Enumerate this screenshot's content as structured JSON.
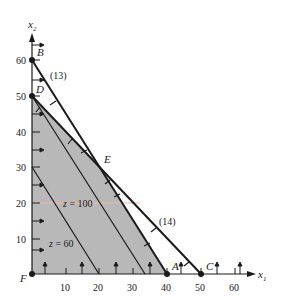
{
  "diagram": {
    "type": "linear-programming-feasible-region",
    "axes": {
      "x_label": "x",
      "x_sub": "1",
      "y_label": "x",
      "y_sub": "2",
      "x_ticks": [
        "10",
        "20",
        "30",
        "40",
        "50",
        "60"
      ],
      "y_ticks": [
        "10",
        "20",
        "30",
        "40",
        "50",
        "60"
      ]
    },
    "points": {
      "A": {
        "label": "A",
        "x1": 40,
        "x2": 0
      },
      "B": {
        "label": "B",
        "x1": 0,
        "x2": 60
      },
      "C": {
        "label": "C",
        "x1": 50,
        "x2": 0
      },
      "D": {
        "label": "D",
        "x1": 0,
        "x2": 50
      },
      "E": {
        "label": "E",
        "x1": 20,
        "x2": 30
      },
      "F": {
        "label": "F",
        "x1": 0,
        "x2": 0
      }
    },
    "constraints": [
      {
        "label": "(13)",
        "from": "B",
        "to": "A"
      },
      {
        "label": "(14)",
        "from": "D",
        "to": "C"
      }
    ],
    "feasible_region": [
      "F",
      "D",
      "E",
      "A"
    ],
    "iso_lines": [
      {
        "label_z": "z",
        "label_eq": " = 60",
        "from": [
          0,
          30
        ],
        "to": [
          20,
          0
        ]
      },
      {
        "label_z": "z",
        "label_eq": " = 100",
        "from": [
          0,
          50
        ],
        "to": [
          33.3,
          0
        ]
      }
    ],
    "colors": {
      "region_fill": "#b8b8b8",
      "line": "#1a1a1a",
      "highlight": "#f0b8a8"
    }
  }
}
